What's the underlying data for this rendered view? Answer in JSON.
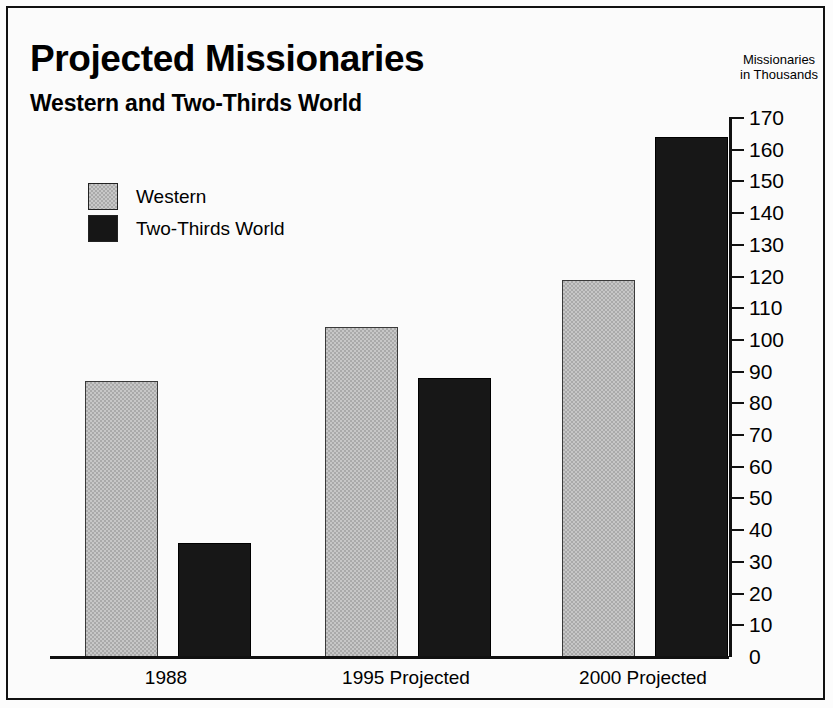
{
  "chart_data": {
    "type": "bar",
    "title": "Projected Missionaries",
    "subtitle": "Western and Two-Thirds World",
    "ylabel": "Missionaries in Thousands",
    "ylabel_line1": "Missionaries",
    "ylabel_line2": "in Thousands",
    "xlabel": "",
    "categories": [
      "1988",
      "1995 Projected",
      "2000 Projected"
    ],
    "series": [
      {
        "name": "Western",
        "color": "#aaaaaa",
        "values": [
          87,
          104,
          119
        ]
      },
      {
        "name": "Two-Thirds World",
        "color": "#171717",
        "values": [
          36,
          88,
          164
        ]
      }
    ],
    "ylim": [
      0,
      170
    ],
    "ytick_step": 10,
    "yticks": [
      0,
      10,
      20,
      30,
      40,
      50,
      60,
      70,
      80,
      90,
      100,
      110,
      120,
      130,
      140,
      150,
      160,
      170
    ],
    "grid": false,
    "legend_position": "upper-left"
  },
  "legend": {
    "entries": [
      {
        "label": "Western",
        "swatch": "gray"
      },
      {
        "label": "Two-Thirds World",
        "swatch": "black"
      }
    ]
  }
}
